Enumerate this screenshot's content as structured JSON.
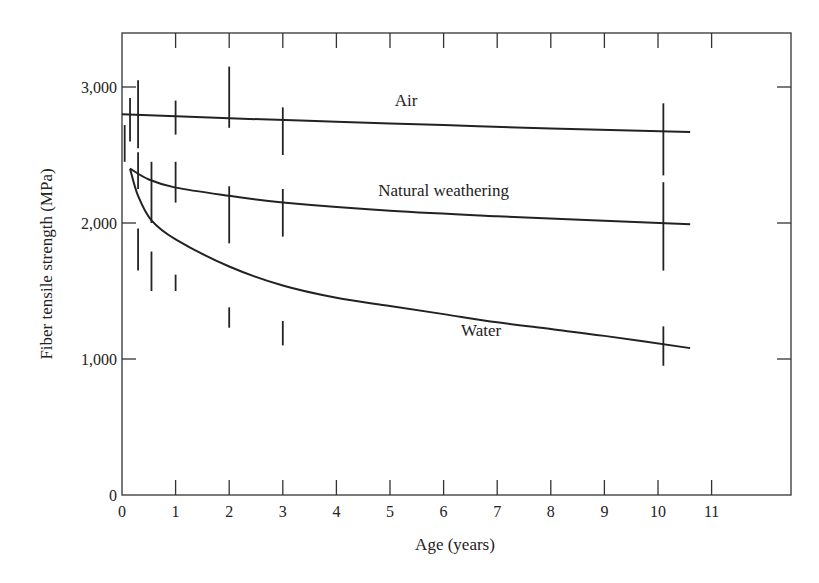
{
  "chart_data": {
    "type": "line",
    "title": "",
    "xlabel": "Age (years)",
    "ylabel": "Fiber tensile strength (MPa)",
    "xlim": [
      0,
      12.5
    ],
    "ylim": [
      0,
      3400
    ],
    "xticks": [
      0,
      1,
      2,
      3,
      4,
      5,
      6,
      7,
      8,
      9,
      10,
      11
    ],
    "xtick_labels": [
      "0",
      "1",
      "2",
      "3",
      "4",
      "5",
      "6",
      "7",
      "8",
      "9",
      "10",
      "11"
    ],
    "yticks": [
      0,
      1000,
      2000,
      3000
    ],
    "ytick_labels": [
      "0",
      "1,000",
      "2,000",
      "3,000"
    ],
    "grid": false,
    "legend": "inline labels",
    "series": [
      {
        "name": "Air",
        "label_pos": [
          5.3,
          2860
        ],
        "curve": [
          [
            0,
            2800
          ],
          [
            2,
            2770
          ],
          [
            4,
            2745
          ],
          [
            6,
            2720
          ],
          [
            8,
            2695
          ],
          [
            10.6,
            2670
          ]
        ],
        "error_bars": [
          {
            "x": 0.15,
            "low": 2600,
            "high": 2920
          },
          {
            "x": 0.3,
            "low": 2550,
            "high": 3050
          },
          {
            "x": 1.0,
            "low": 2650,
            "high": 2900
          },
          {
            "x": 2.0,
            "low": 2700,
            "high": 3150
          },
          {
            "x": 3.0,
            "low": 2500,
            "high": 2850
          },
          {
            "x": 10.1,
            "low": 2350,
            "high": 2880
          }
        ]
      },
      {
        "name": "Natural weathering",
        "label_pos": [
          6.0,
          2200
        ],
        "curve": [
          [
            0.15,
            2400
          ],
          [
            0.5,
            2320
          ],
          [
            1,
            2260
          ],
          [
            2,
            2200
          ],
          [
            3,
            2150
          ],
          [
            5,
            2090
          ],
          [
            7,
            2050
          ],
          [
            10.6,
            1990
          ]
        ],
        "error_bars": [
          {
            "x": 0.05,
            "low": 2450,
            "high": 2720
          },
          {
            "x": 0.3,
            "low": 2250,
            "high": 2520
          },
          {
            "x": 0.55,
            "low": 2000,
            "high": 2450
          },
          {
            "x": 1.0,
            "low": 2150,
            "high": 2450
          },
          {
            "x": 2.0,
            "low": 1850,
            "high": 2270
          },
          {
            "x": 3.0,
            "low": 1900,
            "high": 2250
          },
          {
            "x": 10.1,
            "low": 1650,
            "high": 2300
          }
        ]
      },
      {
        "name": "Water",
        "label_pos": [
          6.7,
          1170
        ],
        "curve": [
          [
            0.15,
            2400
          ],
          [
            0.3,
            2200
          ],
          [
            0.55,
            2020
          ],
          [
            1,
            1880
          ],
          [
            2,
            1680
          ],
          [
            3,
            1540
          ],
          [
            4,
            1450
          ],
          [
            5,
            1390
          ],
          [
            6,
            1330
          ],
          [
            7,
            1270
          ],
          [
            8,
            1220
          ],
          [
            9,
            1170
          ],
          [
            10.6,
            1080
          ]
        ],
        "error_bars": [
          {
            "x": 0.3,
            "low": 1650,
            "high": 1960
          },
          {
            "x": 0.55,
            "low": 1500,
            "high": 1790
          },
          {
            "x": 1.0,
            "low": 1500,
            "high": 1620
          },
          {
            "x": 2.0,
            "low": 1230,
            "high": 1380
          },
          {
            "x": 3.0,
            "low": 1100,
            "high": 1280
          },
          {
            "x": 10.1,
            "low": 950,
            "high": 1240
          }
        ]
      }
    ]
  }
}
